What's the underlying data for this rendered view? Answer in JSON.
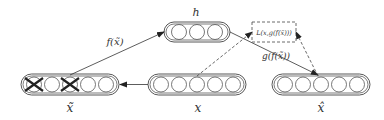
{
  "diagram": {
    "layers": {
      "x_tilde": {
        "label": "x̃",
        "units": 5,
        "corrupted_units": [
          0,
          2
        ]
      },
      "h": {
        "label": "h",
        "units": 3
      },
      "x": {
        "label": "x",
        "units": 5
      },
      "x_hat": {
        "label": "x̂",
        "units": 5
      }
    },
    "edges": {
      "encoder": {
        "label": "f(x̃)",
        "from": "x_tilde",
        "to": "h"
      },
      "decoder": {
        "label": "g(f(x̃))",
        "from": "h",
        "to": "x_hat"
      },
      "corruption": {
        "from": "x",
        "to": "x_tilde"
      },
      "loss_from_x": {
        "from": "x",
        "to": "loss",
        "style": "dashed"
      },
      "loss_from_xhat": {
        "from": "x_hat",
        "to": "loss",
        "style": "dashed"
      }
    },
    "loss_box": {
      "label": "L(x,g(f(x̃)))"
    },
    "colors": {
      "stroke": "#333333",
      "background": "#ffffff"
    }
  }
}
